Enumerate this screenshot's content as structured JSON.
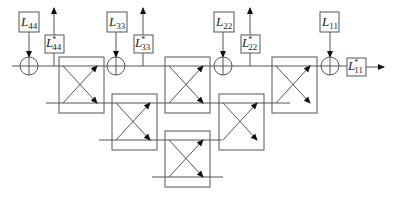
{
  "diagram": {
    "colors": {
      "stroke": "#555555",
      "arrow": "#111111",
      "background": "#ffffff"
    },
    "inputs": [
      {
        "id": "L44",
        "base": "L",
        "sub": "44",
        "x": 19,
        "y": 12
      },
      {
        "id": "L33",
        "base": "L",
        "sub": "33",
        "x": 107,
        "y": 12
      },
      {
        "id": "L22",
        "base": "L",
        "sub": "22",
        "x": 214,
        "y": 12
      },
      {
        "id": "L11",
        "base": "L",
        "sub": "11",
        "x": 320,
        "y": 12
      }
    ],
    "outputs": [
      {
        "id": "L44star",
        "base": "L",
        "sup": "*",
        "sub": "44",
        "x": 45,
        "y": 35
      },
      {
        "id": "L33star",
        "base": "L",
        "sup": "*",
        "sub": "33",
        "x": 134,
        "y": 35
      },
      {
        "id": "L22star",
        "base": "L",
        "sup": "*",
        "sub": "22",
        "x": 241,
        "y": 35
      },
      {
        "id": "L11star",
        "base": "L",
        "sup": "*",
        "sub": "11",
        "x": 347,
        "y": 58
      }
    ],
    "adders": [
      {
        "id": "adder-1",
        "cx": 29,
        "cy": 66
      },
      {
        "id": "adder-2",
        "cx": 116,
        "cy": 66
      },
      {
        "id": "adder-3",
        "cx": 223,
        "cy": 66
      },
      {
        "id": "adder-4",
        "cx": 330,
        "cy": 66
      }
    ],
    "cells": [
      {
        "id": "cell-r1-c1",
        "x": 59,
        "y": 57
      },
      {
        "id": "cell-r1-c2",
        "x": 165,
        "y": 57
      },
      {
        "id": "cell-r1-c3",
        "x": 272,
        "y": 57
      },
      {
        "id": "cell-r2-c1",
        "x": 112,
        "y": 94
      },
      {
        "id": "cell-r2-c2",
        "x": 219,
        "y": 94
      },
      {
        "id": "cell-r3-c1",
        "x": 165,
        "y": 131
      }
    ],
    "rows": [
      66,
      103,
      140,
      177
    ]
  }
}
